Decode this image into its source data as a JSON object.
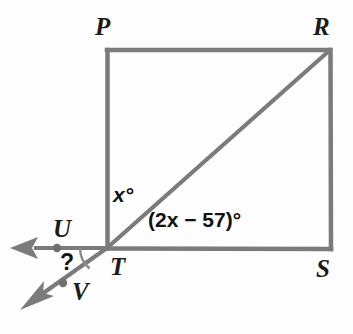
{
  "figure": {
    "type": "geometry-diagram",
    "background_color": "#fdfdfd",
    "stroke_color": "#7b7b7b",
    "label_color": "#1b1b1b",
    "vertices": [
      {
        "id": "P",
        "label": "P",
        "x": 107,
        "y": 50
      },
      {
        "id": "R",
        "label": "R",
        "x": 330,
        "y": 50
      },
      {
        "id": "S",
        "label": "S",
        "x": 331,
        "y": 249
      },
      {
        "id": "T",
        "label": "T",
        "x": 107,
        "y": 248
      },
      {
        "id": "U",
        "label": "U",
        "x": 57,
        "y": 248
      },
      {
        "id": "V",
        "label": "V",
        "x": 63,
        "y": 283
      }
    ],
    "segments": [
      {
        "name": "top-edge-PR",
        "from": "P",
        "to": "R"
      },
      {
        "name": "right-edge-RS",
        "from": "R",
        "to": "S"
      },
      {
        "name": "bottom-edge-TS",
        "from": "T",
        "to": "S"
      },
      {
        "name": "left-edge-PT",
        "from": "P",
        "to": "T"
      },
      {
        "name": "diagonal-TR",
        "from": "T",
        "to": "R"
      }
    ],
    "rays": [
      {
        "name": "ray-TU",
        "from": "T",
        "through": "U",
        "direction": "left",
        "arrowhead": true,
        "dot_at": "U"
      },
      {
        "name": "ray-TV",
        "from": "T",
        "through": "V",
        "direction": "down-left",
        "arrowhead": true,
        "dot_at": "V"
      }
    ],
    "angles": [
      {
        "id": "x",
        "label": "x°",
        "vertex": "T",
        "between": [
          "left-edge-PT",
          "diagonal-TR"
        ],
        "expression": "x"
      },
      {
        "id": "2x-57",
        "label": "(2x − 57)°",
        "vertex": "T",
        "between": [
          "diagonal-TR",
          "bottom-edge-TS"
        ],
        "expression": "2x - 57"
      },
      {
        "id": "unknown",
        "label": "?",
        "vertex": "T",
        "between": [
          "ray-TU",
          "ray-TV"
        ],
        "has_arc": true
      }
    ]
  }
}
